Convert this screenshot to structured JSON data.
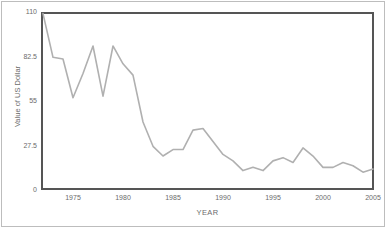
{
  "chart_data": {
    "type": "line",
    "title": "",
    "xlabel": "YEAR",
    "ylabel": "Value of US Dollar",
    "xlim": [
      1971.8,
      2005.1
    ],
    "ylim": [
      0,
      110
    ],
    "grid": false,
    "legend": null,
    "line_color": "#b0b0b0",
    "x": [
      1972,
      1973,
      1974,
      1975,
      1976,
      1977,
      1978,
      1979,
      1980,
      1981,
      1982,
      1983,
      1984,
      1985,
      1986,
      1987,
      1988,
      1989,
      1990,
      1991,
      1992,
      1993,
      1994,
      1995,
      1996,
      1997,
      1998,
      1999,
      2000,
      2001,
      2002,
      2003,
      2004,
      2005
    ],
    "values": [
      109,
      82,
      81,
      57,
      72,
      89,
      58,
      89,
      78,
      71,
      42,
      27,
      21,
      25,
      25,
      37,
      38,
      30,
      22,
      18,
      12,
      14,
      12,
      18,
      20,
      17,
      26,
      21,
      14,
      14,
      17,
      15,
      11,
      13
    ],
    "xticks": [
      1975,
      1980,
      1985,
      1990,
      1995,
      2000,
      2005
    ],
    "xtick_labels": [
      "1975",
      "1980",
      "1985",
      "1990",
      "1995",
      "2000",
      "2005"
    ],
    "yticks": [
      0,
      27.5,
      55,
      82.5,
      110
    ],
    "ytick_labels": [
      "0",
      "27.5",
      "55",
      "82.5",
      "110"
    ]
  },
  "axis": {
    "x_title": "YEAR",
    "y_title": "Value of US Dollar"
  },
  "style": {
    "line_color": "#b0b0b0",
    "frame_color": "#555555",
    "border_color": "#bdbdbd",
    "tick_text_color": "#6b6b6b",
    "background": "#ffffff"
  }
}
